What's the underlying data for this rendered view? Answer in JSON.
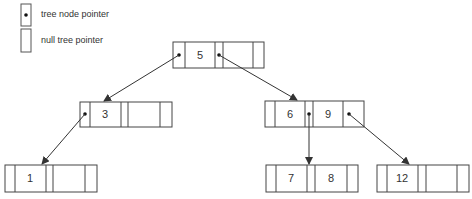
{
  "legend": {
    "items": [
      {
        "label": "tree node pointer",
        "symbol": "box-with-dot"
      },
      {
        "label": "null tree pointer",
        "symbol": "empty-box"
      }
    ]
  },
  "tree": {
    "type": "2-3 tree / B-tree",
    "nodes": [
      {
        "id": "root",
        "keys": [
          "5",
          ""
        ],
        "x": 173,
        "y": 42
      },
      {
        "id": "n3",
        "keys": [
          "3",
          ""
        ],
        "x": 80,
        "y": 102
      },
      {
        "id": "n69",
        "keys": [
          "6",
          "9"
        ],
        "x": 265,
        "y": 101
      },
      {
        "id": "n1",
        "keys": [
          "1",
          ""
        ],
        "x": 5,
        "y": 165
      },
      {
        "id": "n78",
        "keys": [
          "7",
          "8"
        ],
        "x": 266,
        "y": 165
      },
      {
        "id": "n12",
        "keys": [
          "12",
          ""
        ],
        "x": 377,
        "y": 165
      }
    ],
    "edges": [
      {
        "from": "root",
        "ptr": 0,
        "to": "n3"
      },
      {
        "from": "root",
        "ptr": 1,
        "to": "n69"
      },
      {
        "from": "n3",
        "ptr": 0,
        "to": "n1"
      },
      {
        "from": "n69",
        "ptr": 1,
        "to": "n78"
      },
      {
        "from": "n69",
        "ptr": 2,
        "to": "n12"
      }
    ]
  },
  "colors": {
    "stroke": "#444444",
    "text": "#333333",
    "background": "#ffffff"
  }
}
